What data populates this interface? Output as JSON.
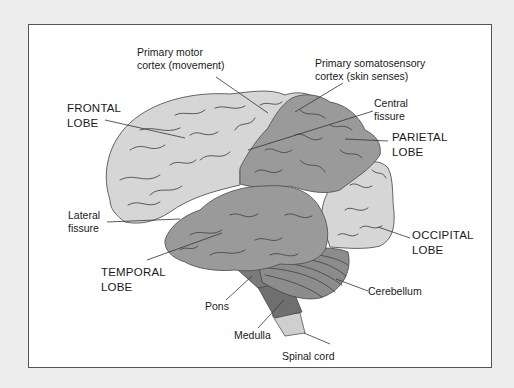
{
  "diagram": {
    "type": "labeled-anatomy",
    "labels": {
      "primary_motor_cortex": {
        "line1": "Primary motor",
        "line2": "cortex (movement)"
      },
      "primary_somatosensory_cortex": {
        "line1": "Primary somatosensory",
        "line2": "cortex (skin senses)"
      },
      "central_fissure": {
        "line1": "Central",
        "line2": "fissure"
      },
      "frontal_lobe": {
        "line1": "FRONTAL",
        "line2": "LOBE"
      },
      "parietal_lobe": {
        "line1": "PARIETAL",
        "line2": "LOBE"
      },
      "lateral_fissure": {
        "line1": "Lateral",
        "line2": "fissure"
      },
      "occipital_lobe": {
        "line1": "OCCIPITAL",
        "line2": "LOBE"
      },
      "temporal_lobe": {
        "line1": "TEMPORAL",
        "line2": "LOBE"
      },
      "cerebellum": "Cerebellum",
      "pons": "Pons",
      "medulla": "Medulla",
      "spinal_cord": "Spinal cord"
    },
    "colors": {
      "background": "#ededed",
      "frame": "#ffffff",
      "frontal_occipital": "#d6d6d6",
      "parietal_temporal": "#9a9a9a",
      "cerebellum": "#8c8c8c",
      "brainstem": "#6f6f6f",
      "spinal_cord": "#cfcfcf",
      "sulci": "#4a4a4a"
    }
  }
}
